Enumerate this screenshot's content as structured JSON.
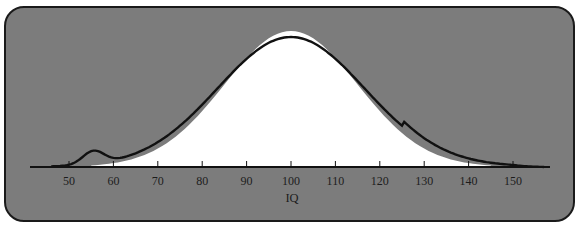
{
  "chart_data": {
    "type": "line",
    "title": "",
    "xlabel": "IQ",
    "ylabel": "",
    "xlim": [
      40,
      160
    ],
    "x_ticks": [
      50,
      60,
      70,
      80,
      90,
      100,
      110,
      120,
      130,
      140,
      150
    ],
    "tick_labels": [
      "50",
      "60",
      "70",
      "80",
      "90",
      "100",
      "110",
      "120",
      "130",
      "140",
      "150"
    ],
    "grid": false,
    "legend": null,
    "series": [
      {
        "name": "Ideal normal distribution (white filled area)",
        "style": "filled-white",
        "mean": 100,
        "sd": 15,
        "x": [
          55,
          60,
          70,
          80,
          90,
          100,
          110,
          120,
          130,
          140,
          145
        ],
        "relative_height": [
          0.01,
          0.03,
          0.14,
          0.41,
          0.8,
          1.0,
          0.8,
          0.41,
          0.14,
          0.03,
          0.01
        ]
      },
      {
        "name": "Actual IQ distribution (black line)",
        "style": "line-black",
        "x": [
          45,
          50,
          55,
          58,
          60,
          62,
          70,
          80,
          90,
          100,
          110,
          120,
          130,
          140,
          150,
          157
        ],
        "relative_height": [
          0.0,
          0.05,
          0.1,
          0.06,
          0.0,
          0.01,
          0.12,
          0.4,
          0.79,
          0.97,
          0.8,
          0.38,
          0.13,
          0.05,
          0.02,
          0.0
        ],
        "annotation": "Secondary bump near IQ 55"
      }
    ]
  },
  "colors": {
    "background": "#7c7c7c",
    "normal_fill": "#ffffff",
    "curve": "#111111",
    "axis": "#111111",
    "border": "#1a1a1a"
  }
}
